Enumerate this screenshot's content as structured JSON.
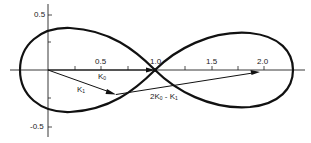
{
  "diagram": {
    "type": "figure-eight curve with vectors",
    "axes": {
      "x_ticks": [
        {
          "value": 0.5,
          "label": "0.5"
        },
        {
          "value": 1.0,
          "label": "1.0"
        },
        {
          "value": 1.5,
          "label": "1.5"
        },
        {
          "value": 2.0,
          "label": "2.0"
        }
      ],
      "y_ticks": [
        {
          "value": 0.5,
          "label": "0.5"
        },
        {
          "value": -0.5,
          "label": "-0.5"
        }
      ]
    },
    "vectors": [
      {
        "name": "K0",
        "label_main": "K",
        "label_sub": "0",
        "from": [
          0,
          0
        ],
        "to": [
          1.0,
          0
        ]
      },
      {
        "name": "K1",
        "label_main": "K",
        "label_sub": "1",
        "from": [
          0,
          0
        ],
        "to": [
          0.64,
          -0.22
        ]
      },
      {
        "name": "2K0-K1",
        "label_main": "2K",
        "label_sub": "0",
        "label_tail": " - K",
        "label_tail_sub": "1",
        "from": [
          0.64,
          -0.22
        ],
        "to": [
          1.96,
          -0.02
        ]
      }
    ]
  }
}
